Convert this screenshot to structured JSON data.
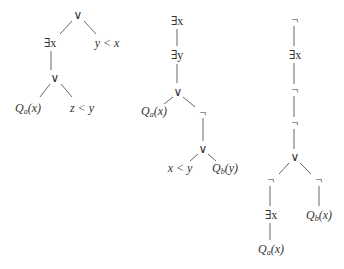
{
  "trees": [
    {
      "nodes": [
        {
          "id": "t1n1",
          "label": "∨",
          "x": 78,
          "y": 15
        },
        {
          "id": "t1n2",
          "label": "∃x",
          "x": 50,
          "y": 43
        },
        {
          "id": "t1n3",
          "label": "y < x",
          "x": 107,
          "y": 43
        },
        {
          "id": "t1n4",
          "label": "∨",
          "x": 55,
          "y": 78
        },
        {
          "id": "t1n5",
          "label": "Qa(x)",
          "x": 28,
          "y": 108
        },
        {
          "id": "t1n6",
          "label": "z < y",
          "x": 82,
          "y": 108
        }
      ]
    },
    {
      "nodes": [
        {
          "id": "t2n1",
          "label": "∃x",
          "x": 177,
          "y": 21
        },
        {
          "id": "t2n2",
          "label": "∃y",
          "x": 177,
          "y": 55
        },
        {
          "id": "t2n3",
          "label": "∨",
          "x": 178,
          "y": 92
        },
        {
          "id": "t2n4",
          "label": "Qa(x)",
          "x": 154,
          "y": 111
        },
        {
          "id": "t2n5",
          "label": "¬",
          "x": 203,
          "y": 113
        },
        {
          "id": "t2n6",
          "label": "∨",
          "x": 203,
          "y": 149
        },
        {
          "id": "t2n7",
          "label": "x < y",
          "x": 180,
          "y": 168
        },
        {
          "id": "t2n8",
          "label": "Qb(y)",
          "x": 225,
          "y": 168
        }
      ]
    },
    {
      "nodes": [
        {
          "id": "t3n1",
          "label": "¬",
          "x": 295,
          "y": 20
        },
        {
          "id": "t3n2",
          "label": "∃x",
          "x": 295,
          "y": 55
        },
        {
          "id": "t3n3",
          "label": "¬",
          "x": 295,
          "y": 90
        },
        {
          "id": "t3n4",
          "label": "¬",
          "x": 295,
          "y": 123
        },
        {
          "id": "t3n5",
          "label": "∨",
          "x": 295,
          "y": 157
        },
        {
          "id": "t3n6",
          "label": "¬",
          "x": 271,
          "y": 180
        },
        {
          "id": "t3n7",
          "label": "¬",
          "x": 319,
          "y": 180
        },
        {
          "id": "t3n8",
          "label": "∃x",
          "x": 271,
          "y": 215
        },
        {
          "id": "t3n9",
          "label": "Qb(x)",
          "x": 319,
          "y": 215
        },
        {
          "id": "t3n10",
          "label": "Qa(x)",
          "x": 271,
          "y": 249
        }
      ]
    }
  ]
}
